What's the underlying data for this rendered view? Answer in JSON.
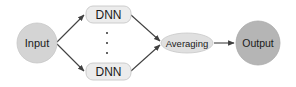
{
  "diagram": {
    "type": "flow",
    "nodes": [
      {
        "id": "input",
        "label": "Input",
        "shape": "circle",
        "fill": "#d4d4d4"
      },
      {
        "id": "dnn_top",
        "label": "DNN",
        "shape": "rounded-rect",
        "fill": "#ececec"
      },
      {
        "id": "dnn_bottom",
        "label": "DNN",
        "shape": "rounded-rect",
        "fill": "#ececec"
      },
      {
        "id": "averaging",
        "label": "Averaging",
        "shape": "ellipse",
        "fill": "#e0e0e0"
      },
      {
        "id": "output",
        "label": "Output",
        "shape": "circle",
        "fill": "#b5b5b5"
      }
    ],
    "ellipsis": "⋮",
    "edges": [
      {
        "from": "input",
        "to": "dnn_top"
      },
      {
        "from": "input",
        "to": "dnn_bottom"
      },
      {
        "from": "dnn_top",
        "to": "averaging"
      },
      {
        "from": "dnn_bottom",
        "to": "averaging"
      },
      {
        "from": "averaging",
        "to": "output"
      }
    ],
    "colors": {
      "edge": "#404040",
      "text": "#1a1a1a",
      "node_border": "#c8c8c8"
    }
  }
}
